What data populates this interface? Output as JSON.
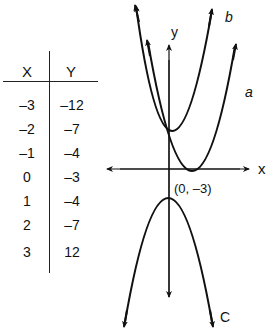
{
  "table": {
    "headers": {
      "x": "X",
      "y": "Y"
    },
    "rows": [
      {
        "x": "–3",
        "y": "–12"
      },
      {
        "x": "–2",
        "y": "–7"
      },
      {
        "x": "–1",
        "y": "–4"
      },
      {
        "x": "0",
        "y": "–3"
      },
      {
        "x": "1",
        "y": "–4"
      },
      {
        "x": "2",
        "y": "–7"
      },
      {
        "x": "3",
        "y": "12"
      }
    ]
  },
  "graph": {
    "axis_labels": {
      "x": "x",
      "y": "y"
    },
    "curve_labels": {
      "a": "a",
      "b": "b",
      "c": "C"
    },
    "vertex_label": "(0, –3)",
    "colors": {
      "stroke": "#111111",
      "background": "#ffffff"
    }
  }
}
